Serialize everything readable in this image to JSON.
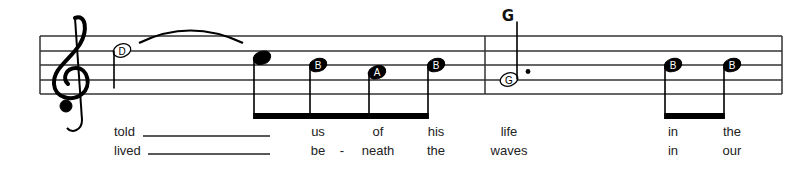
{
  "score": {
    "clef": "treble",
    "chord_symbols": [
      {
        "label": "G",
        "at_note": 6
      }
    ],
    "notes": [
      {
        "pitch": "D",
        "label": "D",
        "duration": "half",
        "filled": false,
        "stem": "down"
      },
      {
        "pitch": "C",
        "label": "",
        "duration": "eighth",
        "filled": true,
        "stem": "down",
        "beam_group": 1
      },
      {
        "pitch": "B",
        "label": "B",
        "duration": "eighth",
        "filled": true,
        "stem": "down",
        "beam_group": 1
      },
      {
        "pitch": "A",
        "label": "A",
        "duration": "eighth",
        "filled": true,
        "stem": "down",
        "beam_group": 1
      },
      {
        "pitch": "B",
        "label": "B",
        "duration": "eighth",
        "filled": true,
        "stem": "down",
        "beam_group": 1
      },
      {
        "pitch": "G",
        "label": "G",
        "duration": "dotted-half",
        "filled": false,
        "stem": "up"
      },
      {
        "pitch": "B",
        "label": "B",
        "duration": "eighth",
        "filled": true,
        "stem": "down",
        "beam_group": 2
      },
      {
        "pitch": "B",
        "label": "B",
        "duration": "eighth",
        "filled": true,
        "stem": "down",
        "beam_group": 2
      }
    ],
    "tie": {
      "from_note": 0,
      "to_note": 1
    },
    "lyrics": {
      "verse1": [
        "told",
        "",
        "us",
        "of",
        "his",
        "life",
        "in",
        "the"
      ],
      "verse2": [
        "lived",
        "",
        "be",
        "neath",
        "the",
        "waves",
        "in",
        "our"
      ],
      "hyphen": "-"
    }
  }
}
